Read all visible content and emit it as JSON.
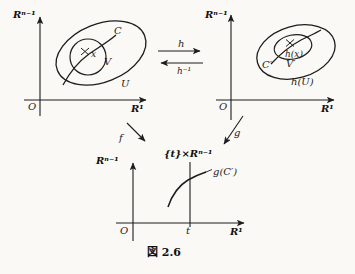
{
  "figure": {
    "caption": "図 2.6",
    "colors": {
      "ink": "#1d1d1d",
      "paper": "#faf9f5"
    }
  },
  "left_panel": {
    "y_axis_label": "Rⁿ⁻¹",
    "x_axis_label": "R¹",
    "origin_label": "O",
    "outer_set_label": "U",
    "inner_set_label": "V",
    "curve_label": "C",
    "point_label": "x"
  },
  "right_panel": {
    "y_axis_label": "Rⁿ⁻¹",
    "x_axis_label": "R¹",
    "origin_label": "O",
    "outer_set_label": "h(U)",
    "inner_set_label": "V′",
    "curve_label": "C′",
    "point_label": "h(x)"
  },
  "bottom_panel": {
    "y_axis_label": "Rⁿ⁻¹",
    "x_axis_label": "R¹",
    "origin_label": "O",
    "slice_label": "{t}×Rⁿ⁻¹",
    "t_tick_label": "t",
    "curve_label": "g(C′)"
  },
  "maps": {
    "h_label": "h",
    "h_inverse_label": "h⁻¹",
    "f_label": "f",
    "g_label": "g"
  }
}
